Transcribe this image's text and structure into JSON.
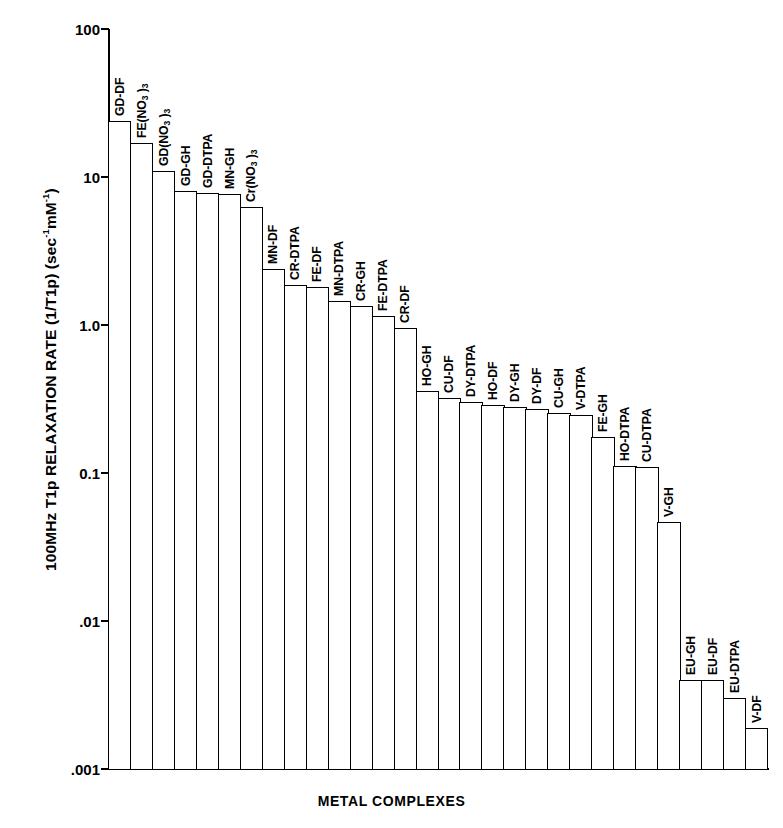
{
  "chart_data": {
    "type": "bar",
    "title": "",
    "xlabel": "METAL COMPLEXES",
    "ylabel": "100MHz T1p RELAXATION RATE (1/T1p) (sec⁻¹mM⁻¹)",
    "ylabel_parts": {
      "main": "100MHz T1p RELAXATION RATE (1/T1p)  (sec",
      "sup1": "-1",
      "mid": "mM",
      "sup2": "-1",
      "end": ")"
    },
    "yscale": "log",
    "ylim": [
      0.001,
      100
    ],
    "ytick_labels": [
      "100",
      "10",
      "1.0",
      "0.1",
      ".01",
      ".001"
    ],
    "ytick_values": [
      100,
      10,
      1.0,
      0.1,
      0.01,
      0.001
    ],
    "grid": false,
    "legend": null,
    "categories": [
      "GD-DF",
      "FE(NO3)3",
      "GD(NO3)3",
      "GD-GH",
      "GD-DTPA",
      "MN-GH",
      "Cr(NO3)3",
      "MN-DF",
      "CR-DTPA",
      "FE-DF",
      "MN-DTPA",
      "CR-GH",
      "FE-DTPA",
      "CR-DF",
      "HO-GH",
      "CU-DF",
      "DY-DTPA",
      "HO-DF",
      "DY-GH",
      "DY-DF",
      "CU-GH",
      "V-DTPA",
      "FE-GH",
      "HO-DTPA",
      "CU-DTPA",
      "V-GH",
      "EU-GH",
      "EU-DF",
      "EU-DTPA",
      "V-DF"
    ],
    "values": [
      24.0,
      17.0,
      11.0,
      8.0,
      7.8,
      7.7,
      6.3,
      2.4,
      1.85,
      1.8,
      1.45,
      1.35,
      1.15,
      0.95,
      0.36,
      0.32,
      0.3,
      0.29,
      0.28,
      0.27,
      0.255,
      0.245,
      0.175,
      0.112,
      0.11,
      0.047,
      0.004,
      0.004,
      0.003,
      0.0019
    ],
    "bar_labels_rich": [
      {
        "text": "GD-DF"
      },
      {
        "text": "FE(NO",
        "sub": "3",
        "tail": " )",
        "sub2": "3"
      },
      {
        "text": "GD(NO",
        "sub": "3",
        "tail": " )",
        "sub2": "3"
      },
      {
        "text": "GD-GH"
      },
      {
        "text": "GD-DTPA"
      },
      {
        "text": "MN-GH"
      },
      {
        "text": "Cr(NO",
        "sub": "3",
        "tail": " )",
        "sub2": "3"
      },
      {
        "text": "MN-DF"
      },
      {
        "text": "CR-DTPA"
      },
      {
        "text": "FE-DF"
      },
      {
        "text": "MN-DTPA"
      },
      {
        "text": "CR-GH"
      },
      {
        "text": "FE-DTPA"
      },
      {
        "text": "CR-DF"
      },
      {
        "text": "HO-GH"
      },
      {
        "text": "CU-DF"
      },
      {
        "text": "DY-DTPA"
      },
      {
        "text": "HO-DF"
      },
      {
        "text": "DY-GH"
      },
      {
        "text": "DY-DF"
      },
      {
        "text": "CU-GH"
      },
      {
        "text": "V-DTPA"
      },
      {
        "text": "FE-GH"
      },
      {
        "text": "HO-DTPA"
      },
      {
        "text": "CU-DTPA"
      },
      {
        "text": "V-GH"
      },
      {
        "text": "EU-GH"
      },
      {
        "text": "EU-DF"
      },
      {
        "text": "EU-DTPA"
      },
      {
        "text": "V-DF"
      }
    ],
    "colors": {
      "bar_fill": "#ffffff",
      "bar_stroke": "#000000",
      "axis": "#000000",
      "background": "#ffffff"
    }
  }
}
